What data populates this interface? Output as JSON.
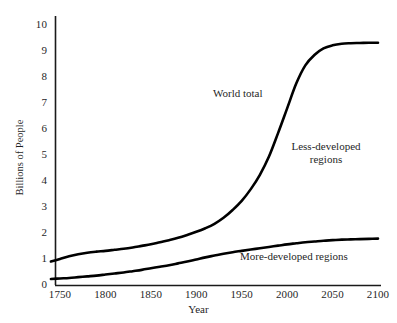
{
  "chart_data": {
    "type": "line",
    "title": "",
    "subtitle": "",
    "xlabel": "Year",
    "ylabel": "Billions of People",
    "xlim": [
      1740,
      2100
    ],
    "ylim": [
      0,
      10
    ],
    "xticks": [
      "1750",
      "1800",
      "1850",
      "1900",
      "1950",
      "2000",
      "2050",
      "2100"
    ],
    "yticks": [
      "0",
      "1",
      "2",
      "3",
      "4",
      "5",
      "6",
      "7",
      "8",
      "9",
      "10"
    ],
    "grid": false,
    "legend_position": "inline-annotations",
    "x": [
      1740,
      1750,
      1760,
      1770,
      1780,
      1790,
      1800,
      1810,
      1820,
      1830,
      1840,
      1850,
      1860,
      1870,
      1880,
      1890,
      1900,
      1910,
      1920,
      1930,
      1940,
      1950,
      1960,
      1970,
      1980,
      1990,
      2000,
      2010,
      2020,
      2030,
      2040,
      2050,
      2060,
      2070,
      2080,
      2090,
      2100
    ],
    "series": [
      {
        "name": "World total",
        "color": "#000000",
        "values": [
          0.92,
          1.02,
          1.12,
          1.2,
          1.26,
          1.3,
          1.33,
          1.37,
          1.41,
          1.46,
          1.52,
          1.58,
          1.66,
          1.74,
          1.83,
          1.94,
          2.06,
          2.2,
          2.37,
          2.6,
          2.9,
          3.25,
          3.7,
          4.25,
          4.95,
          5.85,
          6.8,
          7.75,
          8.45,
          8.85,
          9.1,
          9.22,
          9.28,
          9.3,
          9.31,
          9.32,
          9.32
        ]
      },
      {
        "name": "More-developed regions",
        "color": "#000000",
        "values": [
          0.25,
          0.27,
          0.29,
          0.32,
          0.35,
          0.38,
          0.42,
          0.46,
          0.5,
          0.55,
          0.6,
          0.66,
          0.72,
          0.78,
          0.85,
          0.92,
          1.0,
          1.08,
          1.15,
          1.22,
          1.28,
          1.33,
          1.38,
          1.43,
          1.48,
          1.53,
          1.58,
          1.62,
          1.66,
          1.69,
          1.72,
          1.74,
          1.76,
          1.77,
          1.78,
          1.79,
          1.8
        ]
      }
    ],
    "annotations": [
      {
        "text": "World total",
        "x_px": 213,
        "y_px": 87
      },
      {
        "text": "Less-developed regions",
        "line1": "Less-developed",
        "line2": "regions",
        "x_px": 278,
        "y_px": 140
      },
      {
        "text": "More-developed regions",
        "x_px": 240,
        "y_px": 250
      }
    ]
  },
  "axes": {
    "y_title": "Billions of People",
    "x_title": "Year",
    "y_tick_labels": [
      "10",
      "9",
      "8",
      "7",
      "6",
      "5",
      "4",
      "3",
      "2",
      "1",
      "0"
    ],
    "x_tick_labels": [
      "1750",
      "1800",
      "1850",
      "1900",
      "1950",
      "2000",
      "2050",
      "2100"
    ]
  },
  "annotations": {
    "world_total": "World total",
    "less_developed_line1": "Less-developed",
    "less_developed_line2": "regions",
    "more_developed": "More-developed regions"
  },
  "colors": {
    "line": "#000000",
    "axis": "#1a1a1a",
    "background": "#ffffff",
    "text": "#1f1f1f"
  }
}
